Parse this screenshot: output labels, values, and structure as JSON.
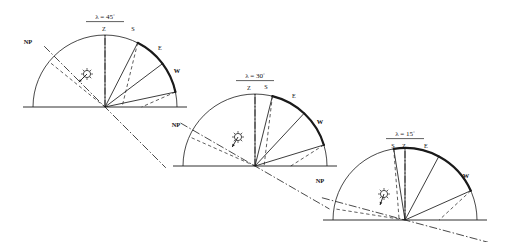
{
  "figure": {
    "background_color": "#ffffff",
    "ink_color": "#1a1a1a",
    "panel_count": 3
  },
  "chart_data": {
    "type": "diagram",
    "panels": [
      {
        "id": "panel-45",
        "lambda_symbol": "λ =",
        "lambda_value": "45",
        "degree_symbol": "°",
        "lambda_label": "λ =  45°",
        "latitude_deg": 45,
        "center": {
          "x": 105,
          "y": 107
        },
        "radius": 72,
        "cardinal_labels": [
          {
            "name": "Z",
            "text": "Z",
            "angle_deg": 90,
            "lx": 104,
            "ly": 31
          },
          {
            "name": "S",
            "text": "S",
            "angle_deg": 63,
            "lx": 133,
            "ly": 31
          },
          {
            "name": "E",
            "text": "E",
            "angle_deg": 37,
            "lx": 160,
            "ly": 50
          },
          {
            "name": "W",
            "text": "W",
            "angle_deg": 12,
            "lx": 177,
            "ly": 73
          },
          {
            "name": "NP",
            "text": "NP",
            "angle_deg": 141,
            "lx": 28,
            "ly": 44
          }
        ],
        "thick_arc": {
          "from_deg": 63,
          "to_deg": 12
        },
        "np_axis_deg": 135,
        "zenith_axis_deg": 90,
        "ray_angles_deg": [
          90,
          63,
          37,
          12
        ],
        "dashed_ray_angles_deg": [
          141,
          63,
          12,
          -45
        ],
        "sun": {
          "x": 87,
          "y": 74,
          "radius": 3.6,
          "arrow_dir_deg": 225
        }
      },
      {
        "id": "panel-30",
        "lambda_symbol": "λ =",
        "lambda_value": "30",
        "degree_symbol": "°",
        "lambda_label": "λ =  30°",
        "latitude_deg": 30,
        "center": {
          "x": 255,
          "y": 166
        },
        "radius": 72,
        "cardinal_labels": [
          {
            "name": "Z",
            "text": "Z",
            "angle_deg": 90,
            "lx": 249,
            "ly": 90
          },
          {
            "name": "S",
            "text": "S",
            "angle_deg": 76,
            "lx": 266,
            "ly": 89
          },
          {
            "name": "E",
            "text": "E",
            "angle_deg": 47,
            "lx": 294,
            "ly": 98
          },
          {
            "name": "W",
            "text": "W",
            "angle_deg": 17,
            "lx": 320,
            "ly": 124
          },
          {
            "name": "NP",
            "text": "NP",
            "angle_deg": 156,
            "lx": 176,
            "ly": 127
          }
        ],
        "thick_arc": {
          "from_deg": 76,
          "to_deg": 17
        },
        "np_axis_deg": 150,
        "zenith_axis_deg": 90,
        "ray_angles_deg": [
          90,
          76,
          47,
          17
        ],
        "dashed_ray_angles_deg": [
          156,
          76,
          17,
          -30
        ],
        "sun": {
          "x": 238,
          "y": 137,
          "radius": 3.6,
          "arrow_dir_deg": 240
        }
      },
      {
        "id": "panel-15",
        "lambda_symbol": "λ =",
        "lambda_value": "15",
        "degree_symbol": "°",
        "lambda_label": "λ =  15°",
        "latitude_deg": 15,
        "center": {
          "x": 405,
          "y": 220
        },
        "radius": 72,
        "cardinal_labels": [
          {
            "name": "S",
            "text": "S",
            "angle_deg": 99,
            "lx": 393,
            "ly": 148
          },
          {
            "name": "Z",
            "text": "Z",
            "angle_deg": 90,
            "lx": 404,
            "ly": 148
          },
          {
            "name": "E",
            "text": "E",
            "angle_deg": 62,
            "lx": 426,
            "ly": 148
          },
          {
            "name": "W",
            "text": "W",
            "angle_deg": 24,
            "lx": 466,
            "ly": 178
          },
          {
            "name": "NP",
            "text": "NP",
            "angle_deg": 171,
            "lx": 320,
            "ly": 183
          }
        ],
        "thick_arc": {
          "from_deg": 99,
          "to_deg": 24
        },
        "np_axis_deg": 165,
        "zenith_axis_deg": 90,
        "ray_angles_deg": [
          99,
          90,
          62,
          24
        ],
        "dashed_ray_angles_deg": [
          171,
          99,
          24,
          -15
        ],
        "sun": {
          "x": 384,
          "y": 194,
          "radius": 3.6,
          "arrow_dir_deg": 250
        }
      }
    ],
    "legend": []
  }
}
